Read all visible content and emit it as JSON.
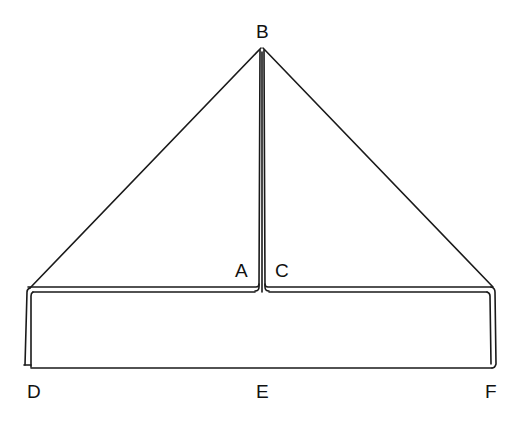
{
  "diagram": {
    "type": "geometric-figure",
    "stroke_color": "#1a1a1a",
    "background": "#ffffff",
    "labels": {
      "B": "B",
      "A": "A",
      "C": "C",
      "D": "D",
      "E": "E",
      "F": "F"
    },
    "points": [
      {
        "name": "B",
        "x": 262,
        "y": 47
      },
      {
        "name": "A",
        "x": 260,
        "y": 291
      },
      {
        "name": "C",
        "x": 265,
        "y": 291
      },
      {
        "name": "D",
        "x": 27,
        "y": 368
      },
      {
        "name": "E",
        "x": 263,
        "y": 368
      },
      {
        "name": "F",
        "x": 495,
        "y": 368
      }
    ]
  }
}
